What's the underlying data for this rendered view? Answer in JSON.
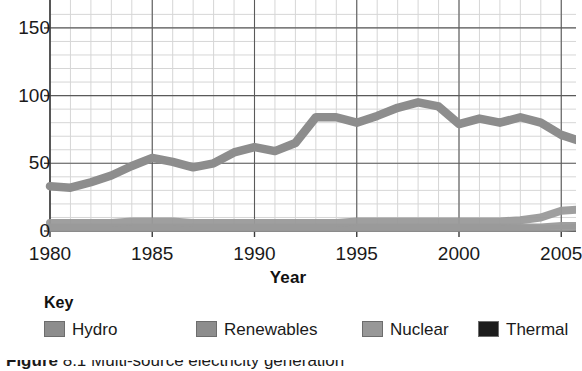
{
  "chart_data": {
    "type": "line",
    "title": "",
    "subtitle": "",
    "xlabel": "Year",
    "ylabel": "",
    "xlim": [
      1980,
      2006.2
    ],
    "ylim": [
      0,
      160
    ],
    "grid": true,
    "grid_major_x_step": 5,
    "grid_minor_x_step": 1,
    "grid_major_y_step": 50,
    "grid_minor_y_step": 10,
    "x_ticks": [
      1980,
      1985,
      1990,
      1995,
      2000,
      2005
    ],
    "x_tick_labels": [
      "1980",
      "1985",
      "1990",
      "1995",
      "2000",
      "2005"
    ],
    "y_ticks": [
      0,
      50,
      100,
      150
    ],
    "y_tick_labels": [
      "0",
      "50",
      "100",
      "150"
    ],
    "legend_position": "below-plot",
    "note": "Plot area is cropped at the top above y=150 and the caption below the key is cut off by the image edge.",
    "x": [
      1980,
      1981,
      1982,
      1983,
      1984,
      1985,
      1986,
      1987,
      1988,
      1989,
      1990,
      1991,
      1992,
      1993,
      1994,
      1995,
      1996,
      1997,
      1998,
      1999,
      2000,
      2001,
      2002,
      2003,
      2004,
      2005,
      2006
    ],
    "series": [
      {
        "name": "Thermal",
        "color": "#8d8d8d",
        "values": [
          33,
          32,
          36,
          41,
          48,
          54,
          51,
          47,
          50,
          58,
          62,
          59,
          65,
          84,
          84,
          80,
          85,
          91,
          95,
          92,
          79,
          83,
          80,
          84,
          80,
          71,
          66
        ]
      },
      {
        "name": "Hydro",
        "color": "#9a9a9a",
        "values": [
          6,
          6,
          6,
          6,
          7,
          7,
          7,
          6,
          6,
          6,
          6,
          6,
          6,
          6,
          6,
          7,
          7,
          7,
          7,
          7,
          7,
          7,
          7,
          8,
          10,
          15,
          16
        ]
      },
      {
        "name": "Renewables",
        "color": "#9a9a9a",
        "values": [
          3,
          3,
          3,
          3,
          3,
          3,
          3,
          3,
          3,
          3,
          3,
          3,
          3,
          3,
          3,
          3,
          3,
          3,
          3,
          3,
          3,
          3,
          3,
          3,
          3,
          4,
          4
        ]
      },
      {
        "name": "Nuclear",
        "color": "#9a9a9a",
        "values": [
          2,
          2,
          2,
          2,
          2,
          2,
          2,
          2,
          2,
          2,
          2,
          2,
          2,
          2,
          2,
          2,
          2,
          2,
          2,
          2,
          2,
          2,
          2,
          2,
          2,
          2,
          3
        ]
      }
    ]
  },
  "axis": {
    "x_title": "Year"
  },
  "key": {
    "title": "Key",
    "items": [
      {
        "label": "Hydro",
        "color": "#8d8d8d",
        "left": 0
      },
      {
        "label": "Renewables",
        "color": "#8d8d8d",
        "left": 152
      },
      {
        "label": "Nuclear",
        "color": "#989898",
        "left": 318
      },
      {
        "label": "Thermal",
        "color": "#1c1c1c",
        "left": 434
      }
    ]
  },
  "caption": {
    "text": "Figure",
    "rest": "  8.1  Multi-source electricity generation"
  },
  "colors": {
    "grid_major": "#5a5a5a",
    "grid_minor": "#d6d6d6",
    "axis": "#3a3a3a",
    "text": "#1a1a1a",
    "background": "#ffffff"
  }
}
